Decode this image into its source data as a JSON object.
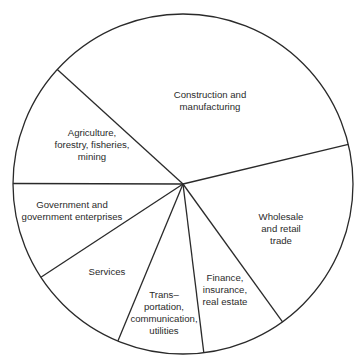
{
  "chart_data": {
    "type": "pie",
    "title": "",
    "start_angle_deg": -13.5,
    "direction": "clockwise",
    "slices": [
      {
        "label": "Wholesale and retail trade",
        "value": 18.8,
        "display": "Wholesale\nand retail\ntrade"
      },
      {
        "label": "Finance, insurance, real estate",
        "value": 8.0,
        "display": "Finance,\ninsurance,\nreal estate"
      },
      {
        "label": "Transportation, communication, utilities",
        "value": 8.2,
        "display": "Trans-\nportation,\ncommunication,\nutilities"
      },
      {
        "label": "Services",
        "value": 9.5,
        "display": "Services"
      },
      {
        "label": "Government and government enterprises",
        "value": 9.3,
        "display": "Government and\ngovernment enterprises"
      },
      {
        "label": "Agriculture, forestry, fisheries, mining",
        "value": 11.7,
        "display": "Agriculture,\nforestry, fisheries,\nmining"
      },
      {
        "label": "Construction and manufacturing",
        "value": 34.5,
        "display": "Construction and\nmanufacturing"
      }
    ],
    "legend": "none",
    "colors": {
      "stroke": "#2a2a2a",
      "fill": "#ffffff",
      "text": "#2b2b2b"
    }
  },
  "labels": {
    "wholesale": "Wholesale\nand retail\ntrade",
    "finance": "Finance,\ninsurance,\nreal estate",
    "transportation": "Trans–\nportation,\ncommunication,\nutilities",
    "services": "Services",
    "government": "Government and\ngovernment enterprises",
    "agriculture": "Agriculture,\nforestry, fisheries,\nmining",
    "construction": "Construction and\nmanufacturing"
  }
}
